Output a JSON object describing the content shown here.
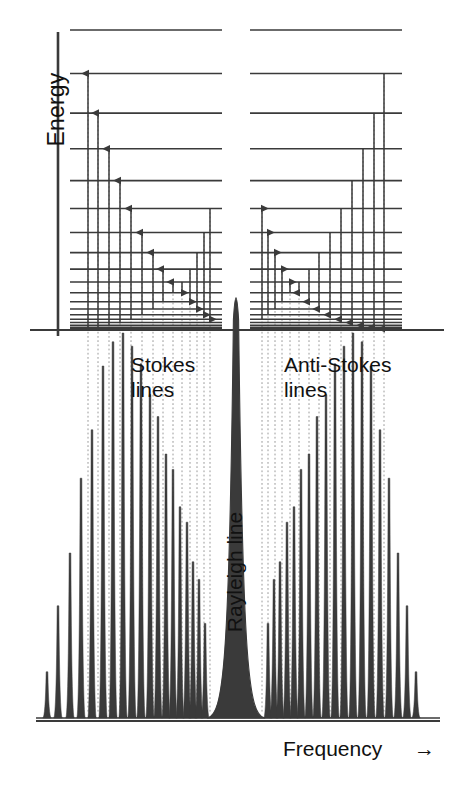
{
  "figure": {
    "domain": "chart",
    "background_color": "#ffffff",
    "ink_color": "#3a3a3a",
    "text_color": "#111111",
    "dotted_color": "#9a9a9a"
  },
  "labels": {
    "energy_axis": "Energy",
    "frequency_axis": "Frequency",
    "frequency_arrow": "→",
    "stokes": "Stokes\nlines",
    "antistokes": "Anti-Stokes\nlines",
    "rayleigh": "Rayleigh line"
  },
  "chart_data": {
    "type": "line",
    "xlabel": "Frequency",
    "ylabel": "Energy",
    "grid": false,
    "legend": false,
    "panels": [
      {
        "name": "energy-level-diagram",
        "description": "Two term-value ladders of rotational levels with J(J+1) spacing; left ladder shows upward (Stokes) transitions, right ladder shows downward (anti-Stokes) transitions.",
        "y_top": 30,
        "y_baseline": 330,
        "levels_normalized": [
          1.0,
          0.855,
          0.723,
          0.604,
          0.498,
          0.405,
          0.325,
          0.258,
          0.203,
          0.16,
          0.124,
          0.094,
          0.07,
          0.051,
          0.036,
          0.025,
          0.016,
          0.009,
          0.004,
          0.0
        ],
        "blocks": [
          {
            "id": "stokes-block",
            "x_left": 70,
            "x_right": 222,
            "arrow_direction": "up",
            "transitions": [
              {
                "from_level": 18,
                "to_level": 1,
                "x": 88
              },
              {
                "from_level": 17,
                "to_level": 2,
                "x": 98
              },
              {
                "from_level": 16,
                "to_level": 3,
                "x": 109
              },
              {
                "from_level": 15,
                "to_level": 4,
                "x": 120
              },
              {
                "from_level": 14,
                "to_level": 5,
                "x": 131
              },
              {
                "from_level": 13,
                "to_level": 6,
                "x": 142
              },
              {
                "from_level": 12,
                "to_level": 7,
                "x": 153
              },
              {
                "from_level": 11,
                "to_level": 8,
                "x": 163
              },
              {
                "from_level": 10,
                "to_level": 9,
                "x": 173
              },
              {
                "from_level": 9,
                "to_level": 10,
                "x": 182
              },
              {
                "from_level": 8,
                "to_level": 11,
                "x": 190
              },
              {
                "from_level": 7,
                "to_level": 12,
                "x": 197
              },
              {
                "from_level": 6,
                "to_level": 13,
                "x": 204
              },
              {
                "from_level": 5,
                "to_level": 14,
                "x": 210
              }
            ]
          },
          {
            "id": "antistokes-block",
            "x_left": 250,
            "x_right": 402,
            "arrow_direction": "down",
            "transitions": [
              {
                "from_level": 1,
                "to_level": 18,
                "x": 384
              },
              {
                "from_level": 2,
                "to_level": 17,
                "x": 374
              },
              {
                "from_level": 3,
                "to_level": 16,
                "x": 363
              },
              {
                "from_level": 4,
                "to_level": 15,
                "x": 352
              },
              {
                "from_level": 5,
                "to_level": 14,
                "x": 341
              },
              {
                "from_level": 6,
                "to_level": 13,
                "x": 330
              },
              {
                "from_level": 7,
                "to_level": 12,
                "x": 319
              },
              {
                "from_level": 8,
                "to_level": 11,
                "x": 309
              },
              {
                "from_level": 9,
                "to_level": 10,
                "x": 299
              },
              {
                "from_level": 10,
                "to_level": 9,
                "x": 290
              },
              {
                "from_level": 11,
                "to_level": 8,
                "x": 282
              },
              {
                "from_level": 12,
                "to_level": 7,
                "x": 275
              },
              {
                "from_level": 13,
                "to_level": 6,
                "x": 268
              },
              {
                "from_level": 14,
                "to_level": 5,
                "x": 262
              }
            ]
          }
        ]
      },
      {
        "name": "raman-spectrum",
        "description": "Rotational Raman spectrum. Intensities alternate strong/weak because of nuclear-spin statistics; envelope peaks a few lines away from the Rayleigh line on each branch.",
        "baseline_y": 718,
        "x_axis_start": 36,
        "x_axis_end": 440,
        "rayleigh": {
          "x": 236,
          "height": 0.955,
          "width": 11,
          "shape": "broad-lorentzian"
        },
        "stokes_branch": {
          "direction": "left-of-rayleigh",
          "x": [
            47,
            58,
            70,
            81,
            92,
            103,
            113,
            123,
            132,
            141,
            150,
            158,
            166,
            173,
            180,
            187,
            193,
            199,
            205
          ],
          "heights": [
            0.105,
            0.255,
            0.375,
            0.545,
            0.655,
            0.8,
            0.855,
            0.875,
            0.845,
            0.805,
            0.735,
            0.685,
            0.6,
            0.565,
            0.48,
            0.445,
            0.355,
            0.315,
            0.215
          ]
        },
        "antistokes_branch": {
          "direction": "right-of-rayleigh",
          "x": [
            268,
            274,
            280,
            287,
            294,
            301,
            309,
            317,
            326,
            335,
            344,
            353,
            362,
            371,
            380,
            389,
            398,
            407,
            416
          ],
          "heights": [
            0.215,
            0.315,
            0.355,
            0.445,
            0.48,
            0.565,
            0.6,
            0.685,
            0.735,
            0.805,
            0.845,
            0.875,
            0.855,
            0.8,
            0.655,
            0.545,
            0.375,
            0.255,
            0.105
          ]
        }
      }
    ],
    "connectors": {
      "description": "Dotted vertical guide lines linking each energy-level transition to its corresponding spectral line.",
      "style": "dotted",
      "stokes_x": [
        88,
        98,
        109,
        120,
        131,
        142,
        153,
        163,
        173,
        182,
        190,
        197,
        204,
        210
      ],
      "antistokes_x": [
        262,
        268,
        275,
        282,
        290,
        299,
        309,
        319,
        330,
        341,
        352,
        363,
        374,
        384
      ]
    }
  }
}
